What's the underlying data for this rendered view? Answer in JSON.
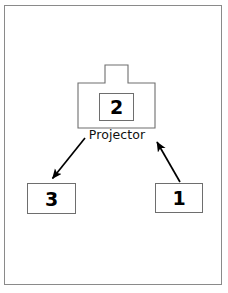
{
  "figure": {
    "width": 228,
    "height": 293,
    "background_color": "#ffffff",
    "frame_color": "#8a8a8a",
    "line_color": "#6e6e6e",
    "arrow_color": "#000000"
  },
  "diagram": {
    "type": "flow-diagram",
    "nodes": [
      {
        "id": "projector",
        "shape": "projector-outline",
        "label": "Projector",
        "inner_box_label": "2"
      },
      {
        "id": "node-3",
        "shape": "rectangle",
        "label": "3"
      },
      {
        "id": "node-1",
        "shape": "rectangle",
        "label": "1"
      }
    ],
    "arrows": [
      {
        "id": "arrow-projector-to-3",
        "from": "projector",
        "to": "node-3",
        "direction": "down-left"
      },
      {
        "id": "arrow-1-to-projector",
        "from": "node-1",
        "to": "projector",
        "direction": "up-left"
      }
    ]
  }
}
